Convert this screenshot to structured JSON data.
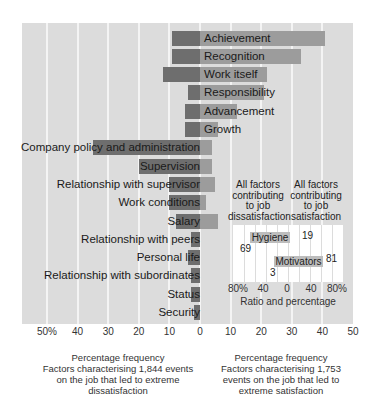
{
  "chart_data": {
    "type": "bar",
    "orientation": "horizontal-diverging",
    "title": "",
    "categories": [
      "Achievement",
      "Recognition",
      "Work itself",
      "Responsibility",
      "Advancement",
      "Growth",
      "Company policy and administration",
      "Supervision",
      "Relationship with supervisor",
      "Work conditions",
      "Salary",
      "Relationship with peers",
      "Personal life",
      "Relationship with subordinates",
      "Status",
      "Security"
    ],
    "series": [
      {
        "name": "Dissatisfaction (left)",
        "color": "#6e6e6e",
        "values": [
          9,
          9,
          12,
          4,
          5,
          5,
          35,
          20,
          10,
          10,
          8,
          3,
          4,
          3,
          3,
          2
        ]
      },
      {
        "name": "Satisfaction (right)",
        "color": "#9c9c9c",
        "values": [
          41,
          33,
          22,
          21,
          12,
          6,
          4,
          4,
          5,
          2,
          6,
          0,
          0,
          0,
          0,
          0
        ]
      }
    ],
    "x_ticks": [
      "50%",
      "40",
      "30",
      "20",
      "10",
      "0",
      "10",
      "20",
      "30",
      "40",
      "50"
    ],
    "xlim": [
      -50,
      50
    ],
    "xlabel_left": "Percentage frequency Factors characterising 1,844 events on the job that led to extreme dissatisfaction",
    "xlabel_right": "Percentage frequency Factors characterising 1,753 events on the job that led to extreme satisfaction",
    "grid": true,
    "inset": {
      "type": "bar",
      "header_left": "All factors contributing to job dissatisfaction",
      "header_right": "All factors contributing to job satisfaction",
      "categories": [
        "Hygiene",
        "Motivators"
      ],
      "dissatisfaction": [
        69,
        3
      ],
      "satisfaction": [
        19,
        81
      ],
      "x_ticks": [
        "80%",
        "40",
        "0",
        "40",
        "80%"
      ],
      "xlabel": "Ratio and percentage"
    }
  },
  "labels": {
    "rows": [
      "Achievement",
      "Recognition",
      "Work itself",
      "Responsibility",
      "Advancement",
      "Growth",
      "Company policy and administration",
      "Supervision",
      "Relationship with supervisor",
      "Work conditions",
      "Salary",
      "Relationship with peers",
      "Personal life",
      "Relationship with subordinates",
      "Status",
      "Security"
    ],
    "ticks": [
      "50%",
      "40",
      "30",
      "20",
      "10",
      "0",
      "10",
      "20",
      "30",
      "40",
      "50"
    ],
    "caption_left": [
      "Percentage frequency",
      "Factors characterising 1,844 events",
      "on the job that led to extreme",
      "dissatisfaction"
    ],
    "caption_right": [
      "Percentage frequency",
      "Factors characterising 1,753",
      "events on the job that led to",
      "extreme satisfaction"
    ],
    "inset": {
      "head_left": [
        "All factors",
        "contributing",
        "to job",
        "dissatisfaction"
      ],
      "head_right": [
        "All factors",
        "contributing",
        "to job",
        "satisfaction"
      ],
      "hygiene": "Hygiene",
      "motivators": "Motivators",
      "hyg_left": "69",
      "hyg_right": "19",
      "mot_left": "3",
      "mot_right": "81",
      "ticks": [
        "80%",
        "40",
        "0",
        "40",
        "80%"
      ],
      "xlabel": "Ratio and percentage"
    }
  }
}
